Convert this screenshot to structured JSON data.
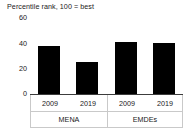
{
  "chart_data": {
    "type": "bar",
    "title": "Percentile rank, 100 = best",
    "xlabel": "",
    "ylabel": "",
    "ylim": [
      0,
      60
    ],
    "yticks": [
      60,
      40,
      20,
      0
    ],
    "grid": false,
    "legend": "none",
    "orientation": "vertical",
    "bar_color": "#000000",
    "categories": [
      "2009",
      "2019",
      "2009",
      "2019"
    ],
    "groups": [
      {
        "name": "MENA",
        "categories": [
          "2009",
          "2019"
        ],
        "values": [
          38,
          25
        ]
      },
      {
        "name": "EMDEs",
        "categories": [
          "2009",
          "2019"
        ],
        "values": [
          41,
          40
        ]
      }
    ],
    "values": [
      38,
      25,
      41,
      40
    ],
    "bars": [
      {
        "group": "MENA",
        "year": "2009",
        "value": 38
      },
      {
        "group": "MENA",
        "year": "2019",
        "value": 25
      },
      {
        "group": "EMDEs",
        "year": "2009",
        "value": 41
      },
      {
        "group": "EMDEs",
        "year": "2019",
        "value": 40
      }
    ]
  },
  "axis": {
    "ytick_60": "60",
    "ytick_40": "40",
    "ytick_20": "20",
    "ytick_0": "0"
  },
  "labels": {
    "year_0": "2009",
    "year_1": "2019",
    "year_2": "2009",
    "year_3": "2019",
    "group_0": "MENA",
    "group_1": "EMDEs"
  },
  "colors": {
    "bar": "#000000",
    "axis": "#3c3c3c",
    "box_border": "#c9c9c9",
    "text": "#1a1a1a",
    "background": "#ffffff"
  }
}
